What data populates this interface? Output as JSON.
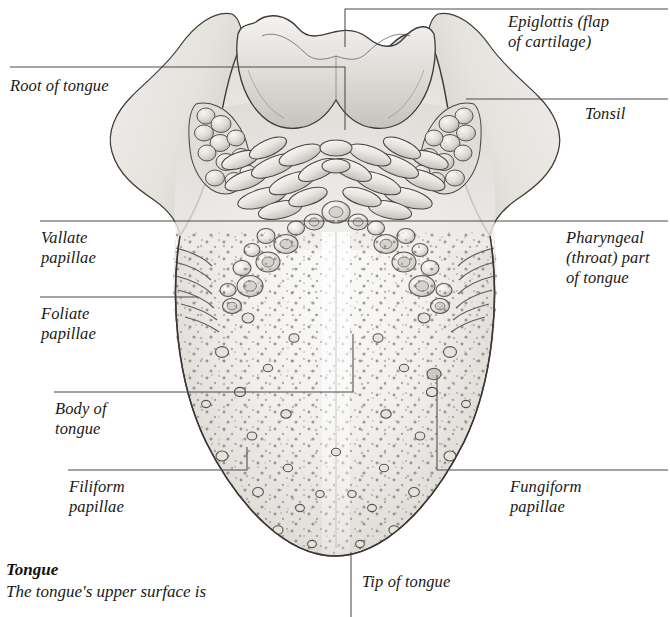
{
  "figure": {
    "kind": "anatomical-illustration",
    "style": "pencil-and-wash medical illustration, greyscale",
    "palette": {
      "ink": "#3a3a3a",
      "leader_line": "#4b4b4b",
      "tissue_light": "#f2f1ef",
      "tissue_mid": "#e3e1de",
      "tissue_shadow": "#c9c6c2",
      "papilla_outline": "#6e6b67",
      "page": "#ffffff",
      "text": "#191919"
    }
  },
  "labels": [
    {
      "id": "epiglottis",
      "text": "Epiglottis (flap\nof cartilage)",
      "side": "right"
    },
    {
      "id": "root",
      "text": "Root of tongue",
      "side": "left"
    },
    {
      "id": "tonsil",
      "text": "Tonsil",
      "side": "right"
    },
    {
      "id": "vallate",
      "text": "Vallate\npapillae",
      "side": "left"
    },
    {
      "id": "pharyngeal",
      "text": "Pharyngeal\n(throat) part\nof tongue",
      "side": "right"
    },
    {
      "id": "foliate",
      "text": "Foliate\npapillae",
      "side": "left"
    },
    {
      "id": "body",
      "text": "Body of\ntongue",
      "side": "left"
    },
    {
      "id": "filiform",
      "text": "Filiform\npapillae",
      "side": "left"
    },
    {
      "id": "fungiform",
      "text": "Fungiform\npapillae",
      "side": "right"
    },
    {
      "id": "tip",
      "text": "Tip of tongue",
      "side": "bottom"
    }
  ],
  "caption": {
    "title": "Tongue",
    "body": "The tongue's upper surface is"
  },
  "structures": [
    {
      "name": "epiglottis",
      "note": "central saddle-shaped flap at the top of the plate"
    },
    {
      "name": "palatine-tonsil",
      "note": "bumpy lobulated cluster, one on each lateral horn"
    },
    {
      "name": "lingual-tonsil",
      "note": "elongate nodules forming a V over the pharyngeal part"
    },
    {
      "name": "vallate-papillae",
      "note": "ring-shaped papillae arranged in a V, about 10 per side"
    },
    {
      "name": "foliate-papillae",
      "note": "parallel vertical ridges on each lateral margin"
    },
    {
      "name": "fungiform-papillae",
      "note": "scattered rounded papillae over the body"
    },
    {
      "name": "filiform-papillae",
      "note": "fine dense stippling covering the body and tip"
    },
    {
      "name": "median-sulcus",
      "note": "pale midline groove running down the body to the tip"
    },
    {
      "name": "tip-of-tongue",
      "note": "rounded apex at the bottom of the plate"
    }
  ]
}
